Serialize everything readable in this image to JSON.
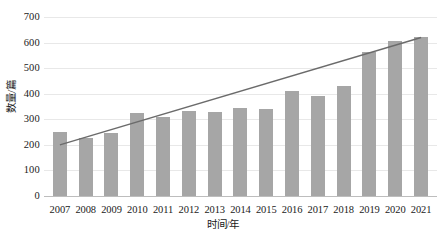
{
  "chart_data": {
    "type": "bar",
    "title": "",
    "subtitle": "",
    "xlabel": "时间/年",
    "ylabel": "数量/篇",
    "categories": [
      "2007",
      "2008",
      "2009",
      "2010",
      "2011",
      "2012",
      "2013",
      "2014",
      "2015",
      "2016",
      "2017",
      "2018",
      "2019",
      "2020",
      "2021"
    ],
    "values": [
      250,
      228,
      247,
      325,
      310,
      333,
      330,
      345,
      340,
      412,
      392,
      432,
      562,
      608,
      622
    ],
    "series": [
      {
        "name": "数量/篇",
        "type": "bar",
        "values": [
          250,
          228,
          247,
          325,
          310,
          333,
          330,
          345,
          340,
          412,
          392,
          432,
          562,
          608,
          622
        ]
      },
      {
        "name": "趋势线",
        "type": "line",
        "trendline": true,
        "x_start": "2007",
        "x_end": "2021",
        "y_start": 200,
        "y_end": 620
      }
    ],
    "ylim": [
      0,
      700
    ],
    "yticks": [
      0,
      100,
      200,
      300,
      400,
      500,
      600,
      700
    ],
    "ytick_labels": [
      "0",
      "100",
      "200",
      "300",
      "400",
      "500",
      "600",
      "700"
    ],
    "grid": true,
    "grid_axis": "y",
    "legend": false,
    "legend_position": "none",
    "colors": {
      "bar": "#a6a6a6",
      "trendline": "#6b6b6b",
      "gridline": "#e8e8e8",
      "axis": "#bdbdbd",
      "text": "#1a1a1a",
      "background": "#ffffff"
    }
  }
}
